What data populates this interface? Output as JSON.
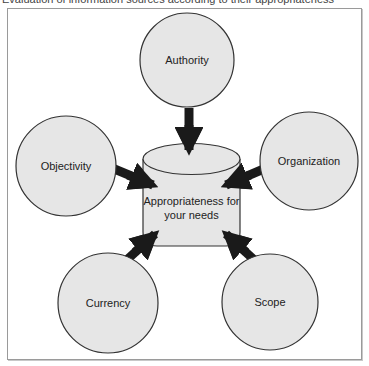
{
  "caption": {
    "text": "Evaluation of information sources according to their appropriateness"
  },
  "diagram": {
    "center": {
      "label_line1": "Appropriateness for",
      "label_line2": "your needs",
      "shape": "cylinder"
    },
    "nodes": [
      {
        "id": "authority",
        "label": "Authority"
      },
      {
        "id": "organization",
        "label": "Organization"
      },
      {
        "id": "scope",
        "label": "Scope"
      },
      {
        "id": "currency",
        "label": "Currency"
      },
      {
        "id": "objectivity",
        "label": "Objectivity"
      }
    ],
    "colors": {
      "node_fill": "#e6e6e6",
      "node_stroke": "#333333",
      "arrow": "#1a1a1a",
      "frame": "#9a9a9a"
    }
  }
}
